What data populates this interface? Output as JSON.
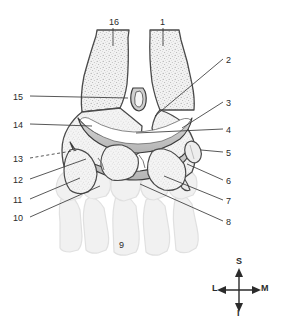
{
  "figure": {
    "background_color": "#ffffff",
    "line_color": "#3a3a3a",
    "bone_fill": "#efefef",
    "cartilage_fill": "#c9c9c9",
    "ghost_bone_fill": "#f0f0f0",
    "ghost_bone_stroke": "#e2e2e2"
  },
  "labels": [
    {
      "id": "16",
      "text": "16",
      "x": 109,
      "y": 18,
      "side": "top"
    },
    {
      "id": "1",
      "text": "1",
      "x": 160,
      "y": 18,
      "side": "top"
    },
    {
      "id": "2",
      "text": "2",
      "x": 226,
      "y": 56,
      "side": "right"
    },
    {
      "id": "3",
      "text": "3",
      "x": 226,
      "y": 99,
      "side": "right"
    },
    {
      "id": "4",
      "text": "4",
      "x": 226,
      "y": 126,
      "side": "right"
    },
    {
      "id": "5",
      "text": "5",
      "x": 226,
      "y": 149,
      "side": "right"
    },
    {
      "id": "6",
      "text": "6",
      "x": 226,
      "y": 177,
      "side": "right"
    },
    {
      "id": "7",
      "text": "7",
      "x": 226,
      "y": 197,
      "side": "right"
    },
    {
      "id": "8",
      "text": "8",
      "x": 226,
      "y": 218,
      "side": "right"
    },
    {
      "id": "9",
      "text": "9",
      "x": 119,
      "y": 241,
      "side": "bottom"
    },
    {
      "id": "10",
      "text": "10",
      "x": 13,
      "y": 214,
      "side": "left"
    },
    {
      "id": "11",
      "text": "11",
      "x": 13,
      "y": 196,
      "side": "left"
    },
    {
      "id": "12",
      "text": "12",
      "x": 13,
      "y": 176,
      "side": "left"
    },
    {
      "id": "13",
      "text": "13",
      "x": 13,
      "y": 155,
      "side": "left"
    },
    {
      "id": "14",
      "text": "14",
      "x": 13,
      "y": 121,
      "side": "left"
    },
    {
      "id": "15",
      "text": "15",
      "x": 13,
      "y": 93,
      "side": "left"
    }
  ],
  "compass": {
    "name": "orientation-compass",
    "center_x": 239,
    "center_y": 290,
    "superior": "S",
    "inferior": "I",
    "lateral": "L",
    "medial": "M"
  }
}
